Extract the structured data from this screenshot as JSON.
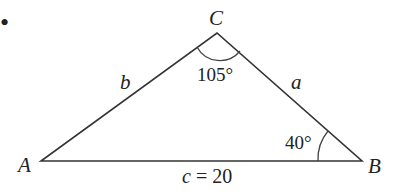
{
  "diagram": {
    "type": "triangle",
    "vertices": {
      "A": {
        "label": "A",
        "x": 41,
        "y": 161
      },
      "B": {
        "label": "B",
        "x": 362,
        "y": 161
      },
      "C": {
        "label": "C",
        "x": 217,
        "y": 33
      }
    },
    "sides": {
      "a": {
        "label": "a"
      },
      "b": {
        "label": "b"
      },
      "c": {
        "label": "c = 20"
      }
    },
    "angles": {
      "C": {
        "label": "105°"
      },
      "B": {
        "label": "40°"
      }
    },
    "bullet": "•"
  }
}
